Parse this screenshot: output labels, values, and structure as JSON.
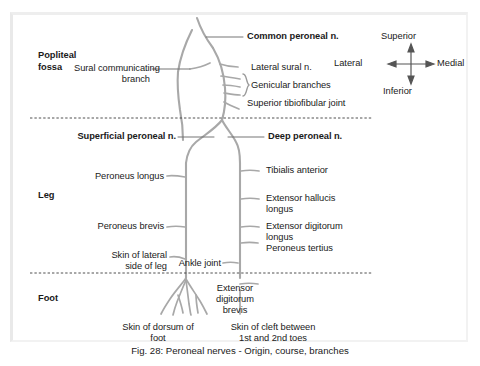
{
  "figure": {
    "caption": "Fig. 28: Peroneal nerves - Origin, course, branches",
    "title": "Peroneal nerves - Origin, course, branches",
    "number": "Fig. 28"
  },
  "regions": [
    {
      "id": "popliteal-fossa",
      "line1": "Popliteal",
      "line2": "fossa"
    },
    {
      "id": "leg",
      "line1": "Leg",
      "line2": ""
    },
    {
      "id": "foot",
      "line1": "Foot",
      "line2": ""
    }
  ],
  "compass": {
    "superior": "Superior",
    "inferior": "Inferior",
    "lateral": "Lateral",
    "medial": "Medial"
  },
  "labels": {
    "common_peroneal": "Common peroneal n.",
    "sural_communicating_l1": "Sural communicating",
    "sural_communicating_l2": "branch",
    "lateral_sural": "Lateral sural n.",
    "genicular_branches": "Genicular branches",
    "superior_tibiofibular_joint": "Superior tibiofibular joint",
    "superficial_peroneal": "Superficial peroneal n.",
    "deep_peroneal": "Deep peroneal n.",
    "peroneus_longus": "Peroneus longus",
    "tibialis_anterior": "Tibialis anterior",
    "peroneus_brevis": "Peroneus brevis",
    "extensor_hallucis_l1": "Extensor hallucis",
    "extensor_hallucis_l2": "longus",
    "extensor_digitorum_l1": "Extensor digitorum",
    "extensor_digitorum_l2": "longus",
    "peroneus_tertius": "Peroneus tertius",
    "skin_lateral_leg_l1": "Skin of lateral",
    "skin_lateral_leg_l2": "side of leg",
    "ankle_joint": "Ankle joint",
    "extensor_digitorum_brevis_l1": "Extensor",
    "extensor_digitorum_brevis_l2": "digitorum",
    "extensor_digitorum_brevis_l3": "brevis",
    "skin_dorsum_foot_l1": "Skin of dorsum of",
    "skin_dorsum_foot_l2": "foot",
    "skin_cleft_l1": "Skin of cleft between",
    "skin_cleft_l2": "1st and 2nd toes"
  },
  "colors": {
    "nerve_stroke": "#a8a8a8",
    "leader_stroke": "#7a7a7a",
    "divider_stroke": "#4a4a4a",
    "text": "#1a1a1a",
    "background": "#ffffff",
    "frame": "#e9e9e9"
  },
  "dividers": [
    {
      "id": "popliteal-leg-divider",
      "y": 118
    },
    {
      "id": "leg-foot-divider",
      "y": 273
    }
  ]
}
